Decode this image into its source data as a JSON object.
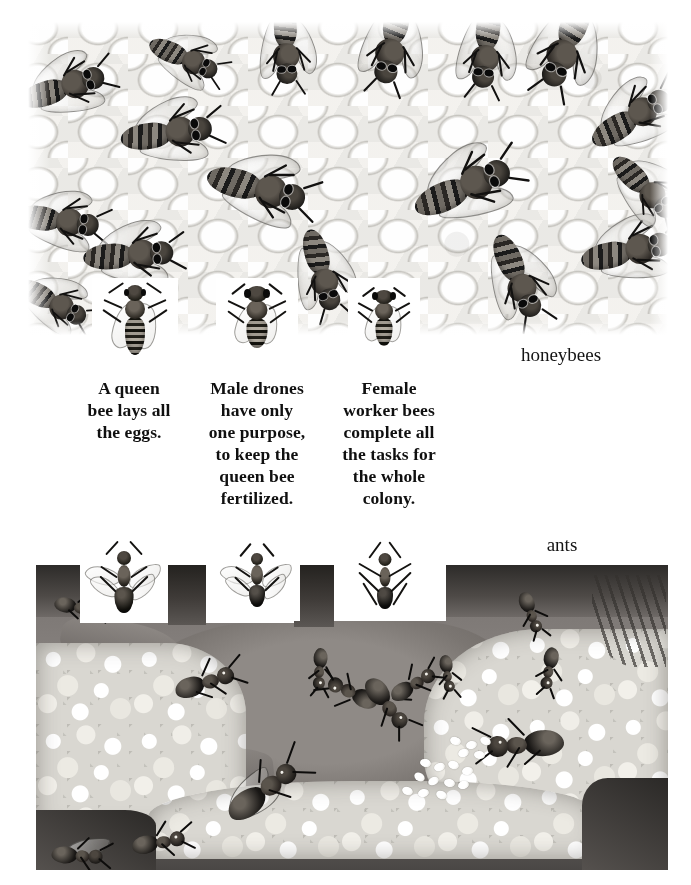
{
  "page": {
    "background_color": "#ffffff",
    "width": 691,
    "height": 885
  },
  "honeybee_section": {
    "label": "honeybees",
    "illustration_name": "honeybees-on-honeycomb",
    "illustration_description": "Pencil and wash drawing of many honeybees crawling over a wax honeycomb",
    "insets": [
      {
        "name": "queen-bee",
        "caption": "A queen\nbee lays all\nthe eggs."
      },
      {
        "name": "drone-bee",
        "caption": "Male drones\nhave only\none purpose,\nto keep the\nqueen bee\nfertilized."
      },
      {
        "name": "worker-bee",
        "caption": "Female\nworker bees\ncomplete all\nthe tasks for\nthe whole\ncolony."
      }
    ]
  },
  "ant_section": {
    "label": "ants",
    "illustration_name": "ant-nest-cross-section",
    "illustration_description": "Cross-section painting of an underground ant nest with tunnels, gravel, worker ants and a pile of white eggs",
    "insets": [
      {
        "name": "winged-queen-ant"
      },
      {
        "name": "winged-male-ant"
      },
      {
        "name": "wingless-worker-ant"
      }
    ]
  },
  "colors": {
    "ink": "#101010",
    "paper": "#ffffff",
    "comb_light": "#f6f5f2",
    "comb_line": "#b0aea8",
    "soil": "#8a8582",
    "soil_dark": "#2d2b29",
    "gravel": "#d9d7d1",
    "egg": "#ffffff"
  }
}
